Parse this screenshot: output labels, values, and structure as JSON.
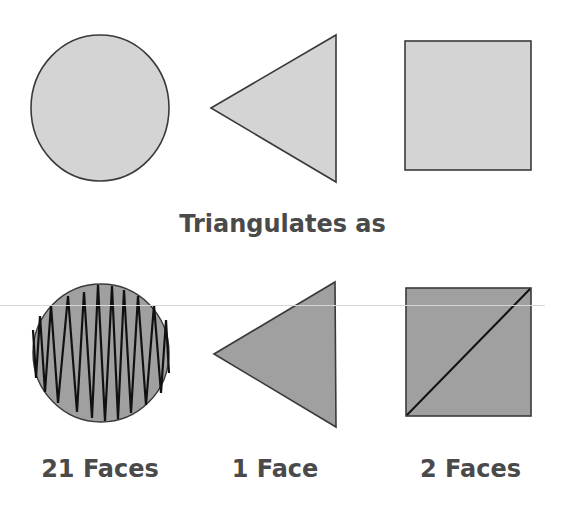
{
  "title": "Triangulates as",
  "shapes_top": [
    {
      "name": "circle",
      "fill": "#d4d4d4",
      "stroke": "#3a3a3a"
    },
    {
      "name": "triangle",
      "fill": "#d4d4d4",
      "stroke": "#3a3a3a"
    },
    {
      "name": "square",
      "fill": "#d4d4d4",
      "stroke": "#3a3a3a"
    }
  ],
  "shapes_bottom": [
    {
      "name": "triangulated-circle",
      "fill": "#a0a0a0",
      "stroke": "#111111"
    },
    {
      "name": "triangulated-triangle",
      "fill": "#a0a0a0",
      "stroke": "#3a3a3a"
    },
    {
      "name": "triangulated-square",
      "fill": "#a0a0a0",
      "stroke": "#111111"
    }
  ],
  "captions": [
    "21 Faces",
    "1 Face",
    "2 Faces"
  ]
}
